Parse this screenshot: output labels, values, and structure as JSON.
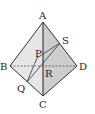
{
  "figure": {
    "type": "tetrahedron",
    "labels": {
      "A": "A",
      "B": "B",
      "C": "C",
      "D": "D",
      "P": "P",
      "Q": "Q",
      "R": "R",
      "S": "S"
    },
    "colors": {
      "face_left": "#e4e4e4",
      "face_right": "#cfcfcf",
      "edge": "#333333",
      "hidden_edge": "#555555"
    }
  }
}
